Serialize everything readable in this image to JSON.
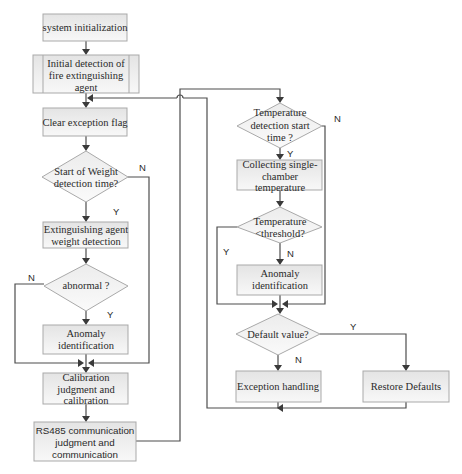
{
  "diagram": {
    "type": "flowchart",
    "nodes": {
      "sys_init": {
        "shape": "process",
        "lines": [
          "system initialization"
        ]
      },
      "initial_detect": {
        "shape": "predefined-process",
        "lines": [
          "Initial detection of",
          "fire extinguishing",
          "agent"
        ]
      },
      "clear_flag": {
        "shape": "process",
        "lines": [
          "Clear exception flag"
        ]
      },
      "weight_start": {
        "shape": "decision",
        "lines": [
          "Start of Weight",
          "detection time?"
        ]
      },
      "weight_detect": {
        "shape": "process",
        "lines": [
          "Extinguishing agent",
          "weight detection"
        ]
      },
      "abnormal": {
        "shape": "decision",
        "lines": [
          "abnormal ?"
        ]
      },
      "anomaly_left": {
        "shape": "process",
        "lines": [
          "Anomaly",
          "identification"
        ]
      },
      "calibration": {
        "shape": "process",
        "lines": [
          "Calibration",
          "judgment and",
          "calibration"
        ]
      },
      "rs485": {
        "shape": "process",
        "lines": [
          "RS485 communication",
          "judgment and",
          "communication"
        ]
      },
      "temp_start": {
        "shape": "decision",
        "lines": [
          "Temperature",
          "detection start",
          "time ?"
        ]
      },
      "collect_temp": {
        "shape": "process",
        "lines": [
          "Collecting single-",
          "chamber",
          "temperature"
        ]
      },
      "temp_threshold": {
        "shape": "decision",
        "lines": [
          "Temperature",
          "<threshold?"
        ]
      },
      "anomaly_right": {
        "shape": "process",
        "lines": [
          "Anomaly",
          "identification"
        ]
      },
      "default_value": {
        "shape": "decision",
        "lines": [
          "Default value?"
        ]
      },
      "exception_handling": {
        "shape": "process",
        "lines": [
          "Exception handling"
        ]
      },
      "restore_defaults": {
        "shape": "process",
        "lines": [
          "Restore Defaults"
        ]
      }
    },
    "edge_labels": {
      "weight_start_no": "N",
      "weight_start_yes": "Y",
      "abnormal_no": "N",
      "abnormal_yes": "Y",
      "temp_start_no": "N",
      "temp_start_yes": "Y",
      "temp_threshold_yes": "Y",
      "temp_threshold_no": "N",
      "default_yes": "Y",
      "default_no": "N"
    },
    "edges": [
      [
        "sys_init",
        "initial_detect",
        ""
      ],
      [
        "initial_detect",
        "clear_flag",
        ""
      ],
      [
        "clear_flag",
        "weight_start",
        ""
      ],
      [
        "weight_start",
        "weight_detect",
        "Y"
      ],
      [
        "weight_start",
        "calibration",
        "N"
      ],
      [
        "weight_detect",
        "abnormal",
        ""
      ],
      [
        "abnormal",
        "anomaly_left",
        "Y"
      ],
      [
        "abnormal",
        "calibration",
        "N"
      ],
      [
        "anomaly_left",
        "calibration",
        ""
      ],
      [
        "calibration",
        "rs485",
        ""
      ],
      [
        "rs485",
        "temp_start",
        ""
      ],
      [
        "temp_start",
        "collect_temp",
        "Y"
      ],
      [
        "temp_start",
        "default_value",
        "N"
      ],
      [
        "collect_temp",
        "temp_threshold",
        ""
      ],
      [
        "temp_threshold",
        "anomaly_right",
        "N"
      ],
      [
        "temp_threshold",
        "default_value",
        "Y"
      ],
      [
        "anomaly_right",
        "default_value",
        ""
      ],
      [
        "default_value",
        "exception_handling",
        "N"
      ],
      [
        "default_value",
        "restore_defaults",
        "Y"
      ],
      [
        "exception_handling",
        "clear_flag",
        ""
      ],
      [
        "restore_defaults",
        "clear_flag",
        ""
      ]
    ],
    "colors": {
      "line": "#4d4d4d",
      "box_border": "#a9a9a9",
      "box_fill_top": "#e6e6e6",
      "box_fill_bottom": "#f7f7f7",
      "text": "#2a2a2a"
    }
  }
}
